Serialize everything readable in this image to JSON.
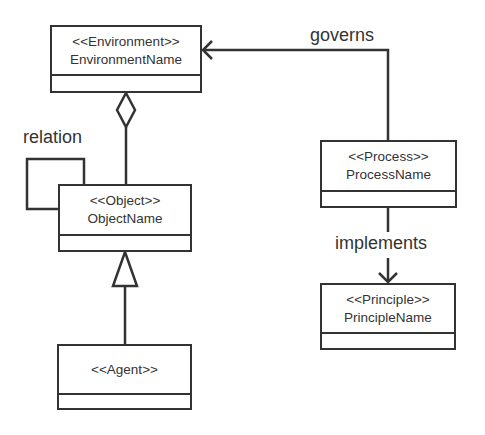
{
  "diagram": {
    "type": "UML class diagram",
    "classes": [
      {
        "id": "environment",
        "stereotype": "<<Environment>>",
        "name": "EnvironmentName"
      },
      {
        "id": "object",
        "stereotype": "<<Object>>",
        "name": "ObjectName"
      },
      {
        "id": "agent",
        "stereotype": "<<Agent>>",
        "name": ""
      },
      {
        "id": "process",
        "stereotype": "<<Process>>",
        "name": "ProcessName"
      },
      {
        "id": "principle",
        "stereotype": "<<Principle>>",
        "name": "PrincipleName"
      }
    ],
    "relationships": [
      {
        "from": "object",
        "to": "environment",
        "kind": "aggregation",
        "label": ""
      },
      {
        "from": "object",
        "to": "object",
        "kind": "association",
        "label": "relation"
      },
      {
        "from": "agent",
        "to": "object",
        "kind": "generalization",
        "label": ""
      },
      {
        "from": "process",
        "to": "environment",
        "kind": "directed-association",
        "label": "governs"
      },
      {
        "from": "process",
        "to": "principle",
        "kind": "directed-association",
        "label": "implements"
      }
    ],
    "labels": {
      "relation": "relation",
      "governs": "governs",
      "implements": "implements"
    },
    "colors": {
      "line": "#333333",
      "background": "#ffffff"
    }
  }
}
